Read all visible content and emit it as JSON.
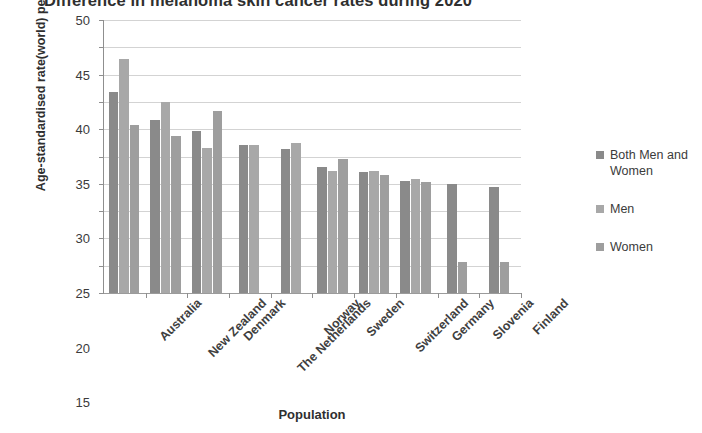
{
  "chart_data": {
    "type": "bar",
    "title": "Difference in melanoma skin cancer rates during 2020",
    "xlabel": "Population",
    "ylabel": "Age-standardised rate(world) per 100,000",
    "ylim": [
      0,
      50
    ],
    "ytick_step": 5,
    "yticks": [
      50,
      45,
      40,
      35,
      30,
      25,
      20,
      15,
      10,
      5,
      0
    ],
    "grid": true,
    "legend_position": "right",
    "categories": [
      "Australia",
      "New Zealand",
      "Denmark",
      "The Netherlands",
      "Norway",
      "Sweden",
      "Switzerland",
      "Germany",
      "Slovenia",
      "Finland"
    ],
    "series": [
      {
        "name": "Both Men and Women",
        "color": "#8a8a8a",
        "values": [
          36.8,
          31.6,
          29.7,
          27.2,
          26.3,
          23.0,
          22.1,
          20.6,
          19.9,
          19.4
        ]
      },
      {
        "name": "Men",
        "color": "#a8a8a8",
        "values": [
          42.9,
          35.0,
          26.6,
          27.2,
          27.5,
          22.3,
          22.4,
          20.8,
          null,
          null
        ]
      },
      {
        "name": "Women",
        "color": "#9e9e9e",
        "values": [
          30.7,
          28.8,
          33.4,
          null,
          null,
          24.5,
          21.6,
          20.4,
          5.7,
          5.7
        ]
      }
    ]
  },
  "legend": {
    "items": [
      {
        "label": "Both Men and Women"
      },
      {
        "label": "Men"
      },
      {
        "label": "Women"
      }
    ]
  }
}
